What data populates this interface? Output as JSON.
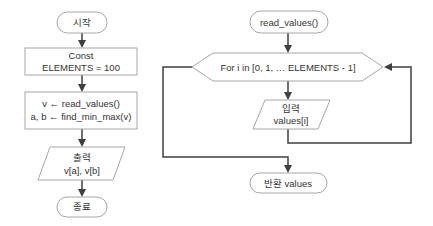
{
  "colors": {
    "background": "#ffffff",
    "shape_fill": "#ffffff",
    "shape_border": "#a6a6a6",
    "connector": "#3f3f3f",
    "text": "#333333"
  },
  "main_flow": {
    "start": {
      "type": "terminator",
      "label": "시작"
    },
    "const": {
      "type": "process",
      "line1": "Const",
      "line2": "ELEMENTS = 100"
    },
    "process": {
      "type": "process",
      "line1": "v ← read_values()",
      "line2": "a, b ← find_min_max(v)"
    },
    "output": {
      "type": "io",
      "line1": "출력",
      "line2": "v[a], v[b]"
    },
    "end": {
      "type": "terminator",
      "label": "종료"
    }
  },
  "read_values_flow": {
    "start": {
      "type": "terminator",
      "label": "read_values()"
    },
    "loop": {
      "type": "loop",
      "label": "For i in [0, 1, … ELEMENTS - 1]"
    },
    "input": {
      "type": "io",
      "line1": "입력",
      "line2": "values[i]"
    },
    "return": {
      "type": "terminator",
      "label": "반환 values"
    }
  }
}
